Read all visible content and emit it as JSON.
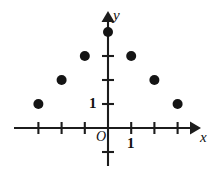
{
  "figure": {
    "kind": "scatter-plot",
    "background_color": "#ffffff",
    "ink_color": "#1c1c1c",
    "point_color": "#141414"
  },
  "labels": {
    "x_axis": "x",
    "y_axis": "y",
    "origin": "O",
    "x_unit": "1",
    "y_unit": "1"
  },
  "chart_data": {
    "type": "scatter",
    "title": "",
    "xlabel": "x",
    "ylabel": "y",
    "grid": false,
    "legend": null,
    "origin_label": "O",
    "xlim": [
      -3.6,
      3.2
    ],
    "ylim": [
      -1.1,
      4.7
    ],
    "xticks": [
      -3,
      -2,
      -1,
      1,
      2,
      3
    ],
    "yticks": [
      1,
      2,
      3,
      -1
    ],
    "xtick_labels": [
      "",
      "",
      "",
      "1",
      "",
      ""
    ],
    "ytick_labels": [
      "1",
      "",
      "",
      ""
    ],
    "x": [
      -3,
      -2,
      -1,
      0,
      1,
      2,
      3
    ],
    "y": [
      1,
      2,
      3,
      4,
      3,
      2,
      1
    ],
    "points": [
      {
        "x": -3,
        "y": 1
      },
      {
        "x": -2,
        "y": 2
      },
      {
        "x": -1,
        "y": 3
      },
      {
        "x": 0,
        "y": 4
      },
      {
        "x": 1,
        "y": 3
      },
      {
        "x": 2,
        "y": 2
      },
      {
        "x": 3,
        "y": 1
      }
    ],
    "point_color": "#141414",
    "marker": "circle"
  },
  "geometry": {
    "origin_px": {
      "x": 108,
      "y": 128
    },
    "unit_px": {
      "x": 23.2,
      "y": 24.0
    },
    "marker_radius_px": 5.0,
    "x_axis_px": {
      "x1": 14,
      "x2": 198,
      "y": 128
    },
    "y_axis_px": {
      "y1": 14,
      "y2": 166,
      "x": 108
    },
    "tick_half_len_px": 6
  }
}
